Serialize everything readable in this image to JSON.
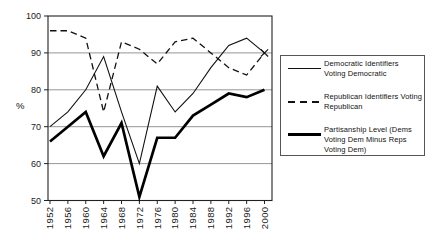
{
  "chart_data": {
    "type": "line",
    "title": "",
    "xlabel": "",
    "ylabel": "%",
    "ylim": [
      50,
      100
    ],
    "yticks": [
      100,
      90,
      80,
      70,
      60,
      50
    ],
    "grid": "horizontal",
    "legend_position": "right",
    "categories": [
      "1952",
      "1956",
      "1960",
      "1964",
      "1968",
      "1972",
      "1976",
      "1980",
      "1984",
      "1988",
      "1992",
      "1996",
      "2000"
    ],
    "series": [
      {
        "name": "Democratic Identifiers Voting Democratic",
        "label_lines": [
          "Democratic Identifiers",
          "Voting Democratic"
        ],
        "style": "thin-solid",
        "color": "#111111",
        "values": [
          70,
          74,
          80,
          89,
          74,
          60,
          81,
          74,
          79,
          86,
          92,
          94,
          90
        ]
      },
      {
        "name": "Republican Identifiers Voting Republican",
        "label_lines": [
          "Republican Identifiers Voting",
          "Republican"
        ],
        "style": "dashed",
        "color": "#111111",
        "values": [
          96,
          96,
          94,
          74,
          93,
          91,
          87,
          93,
          94,
          90,
          86,
          84,
          90
        ]
      },
      {
        "name": "Partisanship Level (Dems Voting Dem Minus Reps Voting Dem)",
        "label_lines": [
          "Partisanship Level (Dems",
          "Voting Dem Minus Reps",
          "Voting Dem)"
        ],
        "style": "thick-solid",
        "color": "#000000",
        "values": [
          66,
          70,
          74,
          62,
          71,
          51,
          67,
          67,
          73,
          76,
          79,
          78,
          80
        ]
      }
    ],
    "annotations": [
      {
        "symbol": "x",
        "year": "2000",
        "value": 90
      }
    ]
  }
}
